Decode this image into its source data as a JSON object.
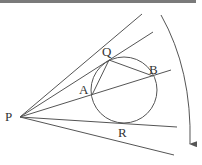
{
  "diagram": {
    "type": "geometry",
    "colors": {
      "stroke": "#555555",
      "text": "#333333",
      "topbar": "#7a7a7a"
    },
    "points": {
      "P": {
        "label": "P",
        "x": 20,
        "y": 117
      },
      "Q": {
        "label": "Q",
        "x": 109,
        "y": 60
      },
      "A": {
        "label": "A",
        "x": 92,
        "y": 95
      },
      "B": {
        "label": "B",
        "x": 153,
        "y": 76
      },
      "R": {
        "label": "R",
        "x": 125,
        "y": 123
      }
    },
    "circle": {
      "cx": 124,
      "cy": 90,
      "r": 33
    },
    "rays_from_P": [
      {
        "name": "upper-ray",
        "x2": 142,
        "y2": 14
      },
      {
        "name": "ray-through-Q",
        "x2": 153,
        "y2": 32
      },
      {
        "name": "secant-through-A-B",
        "x2": 171,
        "y2": 70
      },
      {
        "name": "tangent-through-R",
        "x2": 177,
        "y2": 127
      },
      {
        "name": "lower-ray",
        "x2": 174,
        "y2": 155
      }
    ],
    "chords": [
      {
        "name": "chord-AQ",
        "from": "A",
        "to": "Q"
      },
      {
        "name": "chord-QB",
        "from": "Q",
        "to": "B"
      }
    ],
    "rotation_arrow": {
      "start": [
        161,
        15
      ],
      "end": [
        191,
        147
      ],
      "direction": "clockwise"
    }
  }
}
